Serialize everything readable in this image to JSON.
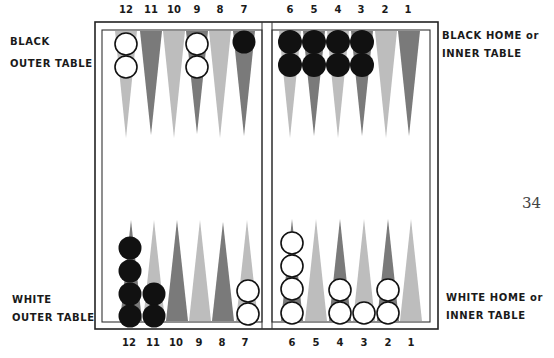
{
  "labels": {
    "black_outer": [
      "BLACK",
      "OUTER TABLE"
    ],
    "black_home": [
      "BLACK HOME or",
      "INNER TABLE"
    ],
    "white_outer": [
      "WHITE",
      "OUTER TABLE"
    ],
    "white_home": [
      "WHITE HOME or",
      "INNER TABLE"
    ]
  },
  "page_number": "34",
  "point_numbers": {
    "left": [
      "12",
      "11",
      "10",
      "9",
      "8",
      "7"
    ],
    "right": [
      "6",
      "5",
      "4",
      "3",
      "2",
      "1"
    ]
  },
  "colors": {
    "dark_point": "#7a7a7a",
    "light_point": "#bdbdbd",
    "black_checker": "#111111",
    "white_checker": "#ffffff",
    "border": "#222222"
  },
  "checkers": {
    "top": [
      {
        "point": "12",
        "color": "white",
        "count": 2
      },
      {
        "point": "9",
        "color": "white",
        "count": 2
      },
      {
        "point": "7",
        "color": "black",
        "count": 1
      },
      {
        "point": "6",
        "color": "black",
        "count": 2
      },
      {
        "point": "5",
        "color": "black",
        "count": 2
      },
      {
        "point": "4",
        "color": "black",
        "count": 2
      },
      {
        "point": "3",
        "color": "black",
        "count": 2
      }
    ],
    "bottom": [
      {
        "point": "12",
        "color": "black",
        "count": 4
      },
      {
        "point": "11",
        "color": "black",
        "count": 2
      },
      {
        "point": "7",
        "color": "white",
        "count": 2
      },
      {
        "point": "6",
        "color": "white",
        "count": 4
      },
      {
        "point": "4",
        "color": "white",
        "count": 2
      },
      {
        "point": "3",
        "color": "white",
        "count": 1
      },
      {
        "point": "2",
        "color": "white",
        "count": 2
      }
    ]
  }
}
